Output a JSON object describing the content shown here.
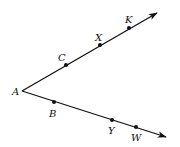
{
  "diagram": {
    "title": "",
    "stroke_color": "#111111",
    "vertex": {
      "label": "A",
      "x": 22,
      "y": 91,
      "label_x": 12,
      "label_y": 95
    },
    "rays": [
      {
        "name": "ray-AK",
        "from": "A",
        "tip": {
          "x": 157,
          "y": 13
        },
        "points": [
          {
            "label": "C",
            "x": 66,
            "y": 65,
            "label_x": 58,
            "label_y": 61
          },
          {
            "label": "X",
            "x": 100,
            "y": 45,
            "label_x": 95,
            "label_y": 41
          },
          {
            "label": "K",
            "x": 129,
            "y": 28,
            "label_x": 125,
            "label_y": 23
          }
        ]
      },
      {
        "name": "ray-AW",
        "from": "A",
        "tip": {
          "x": 166,
          "y": 137
        },
        "points": [
          {
            "label": "B",
            "x": 54,
            "y": 102,
            "label_x": 49,
            "label_y": 117
          },
          {
            "label": "Y",
            "x": 112,
            "y": 120,
            "label_x": 108,
            "label_y": 134
          },
          {
            "label": "W",
            "x": 136,
            "y": 127,
            "label_x": 131,
            "label_y": 141
          }
        ]
      }
    ]
  }
}
